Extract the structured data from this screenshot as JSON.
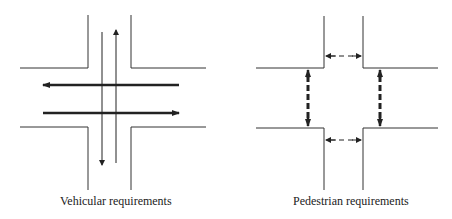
{
  "diagrams": [
    {
      "id": "vehicular",
      "caption": "Vehicular requirements",
      "description": "Four-way intersection with thick two-way horizontal vehicle arrows and thin two-way vertical vehicle arrows"
    },
    {
      "id": "pedestrian",
      "caption": "Pedestrian requirements",
      "description": "Four-way intersection with thick dashed vertical crosswalk arrows and thin dashed horizontal crosswalk arrows"
    }
  ],
  "colors": {
    "stroke": "#222222",
    "curb": "#333333",
    "background": "#ffffff"
  }
}
